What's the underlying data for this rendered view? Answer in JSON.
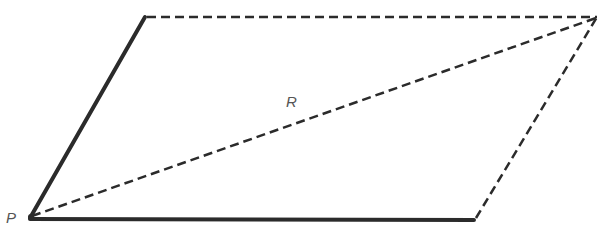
{
  "diagram": {
    "labels": {
      "origin": "P",
      "resultant": "R"
    },
    "colors": {
      "stroke": "#2b2b2b",
      "label": "#555555"
    },
    "points": {
      "P": [
        30,
        218
      ],
      "top_left": [
        145,
        17
      ],
      "top_right": [
        597,
        17
      ],
      "bottom_right": [
        474,
        220
      ]
    }
  }
}
